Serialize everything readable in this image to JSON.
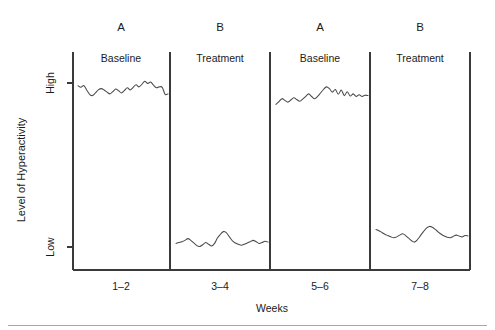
{
  "chart_data": {
    "type": "line",
    "title": "",
    "xlabel": "Weeks",
    "ylabel": "Level of Hyperactivity",
    "ylim": [
      0,
      1
    ],
    "ytick_labels": [
      "High",
      "Low"
    ],
    "ytick_values": [
      0.85,
      0.12
    ],
    "xtick_labels": [
      "1–2",
      "3–4",
      "5–6",
      "7–8"
    ],
    "grid": false,
    "legend": "none",
    "design": "ABAB reversal single-subject design",
    "condition_labels": [
      "A",
      "B",
      "A",
      "B"
    ],
    "phase_labels": [
      "Baseline",
      "Treatment",
      "Baseline",
      "Treatment"
    ],
    "phases": [
      {
        "condition": "A",
        "phase": "Baseline",
        "weeks": "1–2",
        "level": "high",
        "values": [
          0.845,
          0.838,
          0.846,
          0.826,
          0.806,
          0.8,
          0.812,
          0.826,
          0.832,
          0.826,
          0.816,
          0.808,
          0.818,
          0.83,
          0.822,
          0.812,
          0.824,
          0.836,
          0.826,
          0.838,
          0.85,
          0.84,
          0.852,
          0.866,
          0.856,
          0.862,
          0.848,
          0.836,
          0.84,
          0.838,
          0.806,
          0.808
        ]
      },
      {
        "condition": "B",
        "phase": "Treatment",
        "weeks": "3–4",
        "level": "low",
        "values": [
          0.122,
          0.126,
          0.13,
          0.136,
          0.144,
          0.136,
          0.124,
          0.112,
          0.108,
          0.116,
          0.126,
          0.118,
          0.11,
          0.122,
          0.148,
          0.164,
          0.176,
          0.17,
          0.152,
          0.134,
          0.124,
          0.118,
          0.114,
          0.118,
          0.124,
          0.13,
          0.136,
          0.13,
          0.122,
          0.126,
          0.132,
          0.128
        ]
      },
      {
        "condition": "A",
        "phase": "Baseline",
        "weeks": "5–6",
        "level": "high",
        "values": [
          0.76,
          0.772,
          0.786,
          0.778,
          0.77,
          0.78,
          0.79,
          0.782,
          0.774,
          0.784,
          0.796,
          0.808,
          0.796,
          0.786,
          0.796,
          0.812,
          0.828,
          0.84,
          0.832,
          0.816,
          0.828,
          0.806,
          0.826,
          0.8,
          0.818,
          0.798,
          0.808,
          0.796,
          0.804,
          0.796,
          0.802,
          0.8
        ]
      },
      {
        "condition": "B",
        "phase": "Treatment",
        "weeks": "7–8",
        "level": "low",
        "values": [
          0.186,
          0.18,
          0.172,
          0.164,
          0.158,
          0.152,
          0.148,
          0.152,
          0.16,
          0.166,
          0.158,
          0.146,
          0.134,
          0.128,
          0.14,
          0.158,
          0.176,
          0.192,
          0.2,
          0.196,
          0.186,
          0.174,
          0.164,
          0.156,
          0.15,
          0.148,
          0.154,
          0.16,
          0.156,
          0.152,
          0.158,
          0.156
        ]
      }
    ],
    "colors": {
      "line": "#4a4a4a",
      "axis": "#3a3a3a",
      "text": "#1a1a1a",
      "background": "#ffffff"
    }
  }
}
